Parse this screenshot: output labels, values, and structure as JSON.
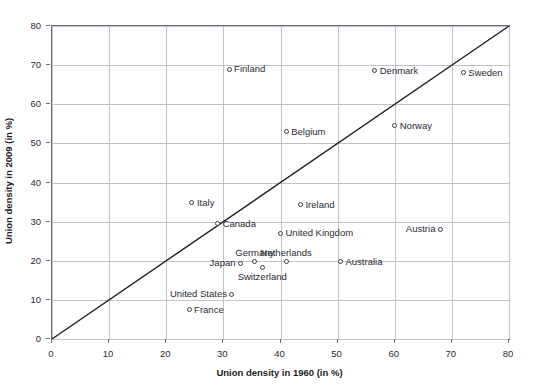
{
  "chart_data": {
    "type": "scatter",
    "title": "",
    "xlabel": "Union density in 1960 (in %)",
    "ylabel": "Union density in 2009 (in %)",
    "xlim": [
      0,
      80
    ],
    "ylim": [
      0,
      80
    ],
    "xticks": [
      0,
      10,
      20,
      30,
      40,
      50,
      60,
      70,
      80
    ],
    "yticks": [
      0,
      10,
      20,
      30,
      40,
      50,
      60,
      70,
      80
    ],
    "grid": true,
    "legend": "none",
    "reference_line": {
      "label": "45-degree identity line",
      "from": [
        0,
        0
      ],
      "to": [
        80,
        80
      ],
      "color": "#1d1d23"
    },
    "marker": {
      "shape": "open-circle",
      "edge_color": "#3a3a42",
      "fill_color": "#ffffff"
    },
    "points": [
      {
        "label": "Finland",
        "x": 31.0,
        "y": 69.0,
        "label_pos": "right"
      },
      {
        "label": "Denmark",
        "x": 56.5,
        "y": 68.5,
        "label_pos": "right"
      },
      {
        "label": "Sweden",
        "x": 72.0,
        "y": 68.0,
        "label_pos": "right"
      },
      {
        "label": "Norway",
        "x": 60.0,
        "y": 54.5,
        "label_pos": "right"
      },
      {
        "label": "Belgium",
        "x": 41.0,
        "y": 53.0,
        "label_pos": "right"
      },
      {
        "label": "Italy",
        "x": 24.5,
        "y": 34.8,
        "label_pos": "right"
      },
      {
        "label": "Ireland",
        "x": 43.5,
        "y": 34.3,
        "label_pos": "right"
      },
      {
        "label": "Canada",
        "x": 29.0,
        "y": 29.5,
        "label_pos": "right"
      },
      {
        "label": "Austria",
        "x": 68.0,
        "y": 28.0,
        "label_pos": "left"
      },
      {
        "label": "United Kingdom",
        "x": 40.0,
        "y": 27.0,
        "label_pos": "right"
      },
      {
        "label": "Netherlands",
        "x": 41.0,
        "y": 19.8,
        "label_pos": "above"
      },
      {
        "label": "Australia",
        "x": 50.5,
        "y": 19.8,
        "label_pos": "right"
      },
      {
        "label": "Germany",
        "x": 35.5,
        "y": 19.8,
        "label_pos": "above"
      },
      {
        "label": "Japan",
        "x": 33.0,
        "y": 19.3,
        "label_pos": "left"
      },
      {
        "label": "Switzerland",
        "x": 36.8,
        "y": 18.3,
        "label_pos": "below"
      },
      {
        "label": "United States",
        "x": 31.5,
        "y": 11.5,
        "label_pos": "left"
      },
      {
        "label": "France",
        "x": 24.0,
        "y": 7.5,
        "label_pos": "right"
      }
    ]
  },
  "colors": {
    "axis": "#6e6e76",
    "grid": "#bfc3c9",
    "text": "#2b2b33",
    "line": "#1d1d23",
    "background": "#ffffff"
  }
}
